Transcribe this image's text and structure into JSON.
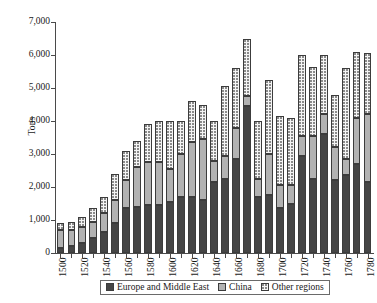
{
  "chart_data": {
    "type": "bar",
    "stacked": true,
    "title": "",
    "xlabel": "",
    "ylabel": "Tons",
    "ylim": [
      0,
      7000
    ],
    "ytick_step": 1000,
    "ytick_labels": [
      "7,000",
      "6,000",
      "5,000",
      "4,000",
      "3,000",
      "2,000",
      "1,000",
      "0"
    ],
    "ytick_values": [
      7000,
      6000,
      5000,
      4000,
      3000,
      2000,
      1000,
      0
    ],
    "grid": false,
    "legend_position": "bottom",
    "categories": [
      "1500",
      "1510",
      "1520",
      "1530",
      "1540",
      "1550",
      "1560",
      "1570",
      "1580",
      "1590",
      "1600",
      "1610",
      "1620",
      "1630",
      "1640",
      "1650",
      "1660",
      "1670",
      "1680",
      "1690",
      "1700",
      "1710",
      "1720",
      "1730",
      "1740",
      "1750",
      "1760",
      "1770",
      "1780"
    ],
    "xtick_labels": [
      "1500",
      "",
      "1520",
      "",
      "1540",
      "",
      "1560",
      "",
      "1580",
      "",
      "1600",
      "",
      "1620",
      "",
      "1640",
      "",
      "1660",
      "",
      "1680",
      "",
      "1700",
      "",
      "1720",
      "",
      "1740",
      "",
      "1760",
      "",
      "1780"
    ],
    "series": [
      {
        "name": "Europe and Middle East",
        "color": "#454545",
        "values": [
          150,
          200,
          300,
          450,
          650,
          900,
          1350,
          1400,
          1450,
          1450,
          1550,
          1700,
          1700,
          1600,
          2150,
          2250,
          2850,
          4450,
          1700,
          1750,
          1350,
          1500,
          2950,
          2250,
          3600,
          2200,
          2350,
          2700,
          2150
        ]
      },
      {
        "name": "China",
        "color": "#b2b2b2",
        "values": [
          550,
          500,
          500,
          500,
          550,
          700,
          850,
          1200,
          1300,
          1300,
          1000,
          1300,
          1650,
          1850,
          650,
          700,
          950,
          300,
          550,
          1250,
          700,
          550,
          600,
          1300,
          600,
          1000,
          500,
          1400,
          2050
        ]
      },
      {
        "name": "Other regions",
        "color": "#f4f4f4",
        "values": [
          200,
          250,
          300,
          400,
          500,
          800,
          900,
          800,
          1150,
          1250,
          1450,
          1000,
          1250,
          1050,
          1200,
          2100,
          1800,
          1750,
          1750,
          2250,
          2100,
          2050,
          2450,
          2100,
          1800,
          1600,
          2750,
          2000,
          1850
        ]
      }
    ],
    "totals": [
      900,
      950,
      1100,
      1350,
      1700,
      2400,
      3100,
      3400,
      3900,
      4000,
      4000,
      4000,
      4600,
      4500,
      4000,
      5050,
      5600,
      6500,
      4000,
      5250,
      4150,
      4100,
      6000,
      5650,
      6000,
      4800,
      5600,
      6100,
      6050
    ]
  },
  "legend": {
    "items": [
      {
        "label": "Europe and Middle East",
        "swatch": "seg-europe"
      },
      {
        "label": "China",
        "swatch": "seg-china"
      },
      {
        "label": "Other regions",
        "swatch": "seg-other"
      }
    ]
  }
}
